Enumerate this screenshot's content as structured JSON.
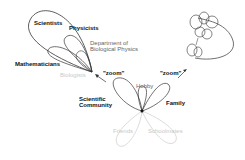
{
  "diagram": {
    "top_left_cluster": {
      "outer_label": "Scientists",
      "sub_labels": [
        "Physicists",
        "Mathematicians"
      ],
      "dept_label_line1": "Department of",
      "dept_label_line2": "Biological Physics",
      "faded_label": "Biologists"
    },
    "center_cluster": {
      "labels": {
        "left": "Scientific",
        "left2": "Community",
        "top": "Hobby",
        "right": "Family",
        "bottom_left": "Friends",
        "bottom_right": "Schoolmates"
      }
    },
    "zoom_left": "\"zoom\"",
    "zoom_right": "\"zoom\"",
    "colors": {
      "line": "#333333",
      "faded": "#cccccc",
      "grey_text": "#666666"
    }
  }
}
